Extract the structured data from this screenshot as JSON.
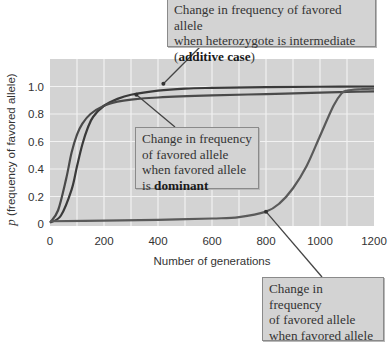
{
  "chart_data": {
    "type": "line",
    "title": "",
    "xlabel": "Number of generations",
    "ylabel_italic": "p",
    "ylabel": "(frequency of favored allele)",
    "xlim": [
      0,
      1200
    ],
    "ylim": [
      0,
      1.2
    ],
    "x_ticks": [
      0,
      200,
      400,
      600,
      800,
      1000,
      1200
    ],
    "x_tick_labels": [
      "0",
      "200",
      "400",
      "600",
      "800",
      "1000",
      "1200"
    ],
    "y_ticks": [
      0,
      0.2,
      0.4,
      0.6,
      0.8,
      1.0
    ],
    "y_tick_labels": [
      "0",
      "0.2",
      "0.4",
      "0.6",
      "0.8",
      "1.0"
    ],
    "grid": true,
    "background": "#d3d3d3",
    "series": [
      {
        "name": "additive",
        "x": [
          0,
          40,
          80,
          100,
          120,
          140,
          160,
          200,
          250,
          300,
          400,
          500,
          600,
          800,
          1000,
          1200
        ],
        "values": [
          0.01,
          0.06,
          0.25,
          0.42,
          0.58,
          0.7,
          0.78,
          0.86,
          0.91,
          0.94,
          0.97,
          0.985,
          0.99,
          0.995,
          0.998,
          1.0
        ]
      },
      {
        "name": "dominant",
        "x": [
          0,
          30,
          60,
          80,
          100,
          120,
          150,
          200,
          250,
          300,
          400,
          600,
          800,
          1000,
          1100,
          1200
        ],
        "values": [
          0.01,
          0.1,
          0.33,
          0.52,
          0.65,
          0.73,
          0.8,
          0.86,
          0.89,
          0.905,
          0.92,
          0.935,
          0.945,
          0.955,
          0.96,
          0.965
        ]
      },
      {
        "name": "recessive",
        "x": [
          0,
          200,
          400,
          600,
          700,
          800,
          850,
          900,
          950,
          1000,
          1050,
          1080,
          1100,
          1150,
          1200
        ],
        "values": [
          0.02,
          0.025,
          0.03,
          0.04,
          0.05,
          0.09,
          0.15,
          0.26,
          0.42,
          0.64,
          0.86,
          0.95,
          0.97,
          0.98,
          0.985
        ]
      }
    ],
    "annotations": [
      {
        "id": "additive",
        "lines": [
          "Change in frequency of favored allele",
          "when heterozygote is intermediate"
        ],
        "prefix": "(",
        "bold": "additive case",
        "suffix": ")",
        "points_to": [
          420,
          1.02
        ]
      },
      {
        "id": "dominant",
        "lines": [
          "Change in frequency",
          "of favored allele",
          "when favored allele"
        ],
        "prefix": "is ",
        "bold": "dominant",
        "suffix": "",
        "points_to": [
          320,
          0.94
        ]
      },
      {
        "id": "recessive",
        "lines": [
          "Change in frequency",
          "of favored allele",
          "when favored allele is"
        ],
        "prefix": "",
        "bold": "recessive",
        "suffix": "",
        "points_to": [
          800,
          0.09
        ]
      }
    ]
  }
}
